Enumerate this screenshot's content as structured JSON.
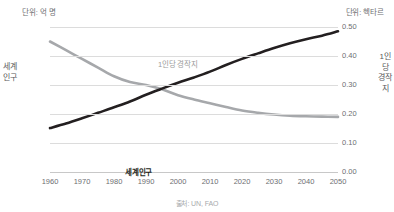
{
  "units": {
    "left": "단위: 억 명",
    "right": "단위: 헥타르"
  },
  "axis_titles": {
    "left": "세계인구",
    "right": "1인당 경작지"
  },
  "series_labels": {
    "population": "세계인구",
    "arable": "1인당 경작지"
  },
  "source": "출처: UN, FAO",
  "colors": {
    "population_line": "#231f20",
    "arable_line": "#a6a8ab",
    "gridline": "#dcdcdc",
    "text": "#58585a",
    "tick_text": "#6d6e71",
    "source_text": "#a7a9ac",
    "background": "#ffffff"
  },
  "chart_data": {
    "type": "line",
    "title": "",
    "subtitle": "",
    "xlabel": "",
    "ylabel": "세계인구",
    "y2label": "1인당 경작지",
    "unit_left": "단위: 억 명",
    "unit_right": "단위: 헥타르",
    "source": "출처: UN, FAO",
    "grid": true,
    "legend": "inline-annotation",
    "x": [
      1960,
      1965,
      1970,
      1975,
      1980,
      1985,
      1990,
      1995,
      2000,
      2005,
      2010,
      2015,
      2020,
      2025,
      2030,
      2035,
      2040,
      2045,
      2050
    ],
    "xlim": [
      1960,
      2050
    ],
    "xticks": [
      1960,
      1970,
      1980,
      1990,
      2000,
      2010,
      2020,
      2030,
      2040,
      2050
    ],
    "ylim": [
      0,
      100
    ],
    "yticks": [
      0,
      20,
      40,
      60,
      80,
      100
    ],
    "y2lim": [
      0.0,
      0.5
    ],
    "y2ticks": [
      "0.00",
      "0.10",
      "0.20",
      "0.30",
      "0.40",
      "0.50"
    ],
    "series": [
      {
        "name": "세계인구",
        "axis": "left",
        "unit": "억 명",
        "color": "#231f20",
        "values": [
          30.3,
          33.4,
          37.0,
          40.8,
          44.6,
          48.6,
          53.3,
          57.5,
          61.5,
          65.2,
          69.2,
          73.8,
          78.0,
          81.8,
          85.5,
          88.8,
          91.6,
          94.0,
          97.0
        ]
      },
      {
        "name": "1인당 경작지",
        "axis": "right",
        "unit": "헥타르",
        "color": "#a6a8ab",
        "values": [
          0.45,
          0.42,
          0.39,
          0.36,
          0.33,
          0.31,
          0.3,
          0.285,
          0.265,
          0.25,
          0.237,
          0.224,
          0.212,
          0.204,
          0.198,
          0.194,
          0.192,
          0.191,
          0.19
        ]
      }
    ],
    "annotations": [
      {
        "text": "1인당 경작지",
        "near_x": 1978,
        "series": "1인당 경작지"
      },
      {
        "text": "세계인구",
        "near_x": 1971,
        "series": "세계인구"
      }
    ]
  }
}
